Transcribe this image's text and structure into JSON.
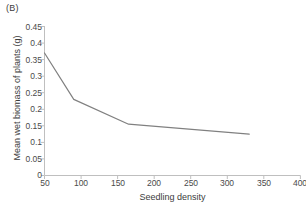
{
  "panel": {
    "label": "(B)"
  },
  "chart_data": {
    "type": "line",
    "title": "(B)",
    "xlabel": "Seedling density",
    "ylabel": "Mean wet biomass of plants (g)",
    "x": [
      50,
      90,
      165,
      330
    ],
    "values": [
      0.37,
      0.23,
      0.155,
      0.125
    ],
    "series": [
      {
        "name": "Mean wet biomass of plants",
        "x": [
          50,
          90,
          165,
          330
        ],
        "values": [
          0.37,
          0.23,
          0.155,
          0.125
        ]
      }
    ],
    "xlim": [
      50,
      400
    ],
    "ylim": [
      0,
      0.45
    ],
    "xticks": [
      50,
      100,
      150,
      200,
      250,
      300,
      350,
      400
    ],
    "yticks": [
      0,
      0.05,
      0.1,
      0.15,
      0.2,
      0.25,
      0.3,
      0.35,
      0.4,
      0.45
    ],
    "xtick_labels": [
      "50",
      "100",
      "150",
      "200",
      "250",
      "300",
      "350",
      "400"
    ],
    "ytick_labels": [
      "0",
      "0.05",
      "0.1",
      "0.15",
      "0.2",
      "0.25",
      "0.3",
      "0.35",
      "0.4",
      "0.45"
    ],
    "grid": false,
    "legend": null,
    "line_color": "#808080",
    "axis_color": "#bfbfbf",
    "marker": "none"
  }
}
